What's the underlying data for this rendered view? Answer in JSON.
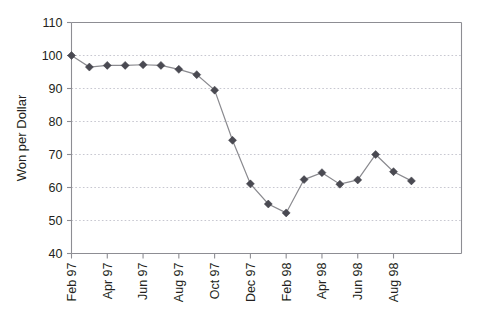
{
  "chart_data": {
    "type": "line",
    "title": "",
    "subtitle": "",
    "xlabel": "",
    "ylabel": "Won per Dollar",
    "ylim": [
      40,
      110
    ],
    "yticks": [
      40,
      50,
      60,
      70,
      80,
      90,
      100,
      110
    ],
    "ytick_labels": [
      "40",
      "50",
      "60",
      "70",
      "80",
      "90",
      "100",
      "110"
    ],
    "grid": "horizontal-dotted",
    "legend": "none",
    "x": [
      "Feb 97",
      "Mar 97",
      "Apr 97",
      "May 97",
      "Jun 97",
      "Jul 97",
      "Aug 97",
      "Sep 97",
      "Oct 97",
      "Nov 97",
      "Dec 97",
      "Jan 98",
      "Feb 98",
      "Mar 98",
      "Apr 98",
      "May 98",
      "Jun 98",
      "Jul 98",
      "Aug 98",
      "Sep 98"
    ],
    "xtick_labels": [
      "Feb 97",
      "Apr 97",
      "Jun 97",
      "Aug 97",
      "Oct 97",
      "Dec 97",
      "Feb 98",
      "Apr 98",
      "Jun 98",
      "Aug 98"
    ],
    "xtick_interval_months": 2,
    "values": [
      100.0,
      96.5,
      97.0,
      97.0,
      97.2,
      97.0,
      95.8,
      94.2,
      89.5,
      74.3,
      61.1,
      55.0,
      52.3,
      62.4,
      64.5,
      61.0,
      62.3,
      70.0,
      64.8,
      62.0
    ],
    "series": [
      {
        "name": "Won per Dollar",
        "marker": "diamond",
        "marker_color": "#4a4a52",
        "line_color": "#8a8a8f",
        "values": [
          100.0,
          96.5,
          97.0,
          97.0,
          97.2,
          97.0,
          95.8,
          94.2,
          89.5,
          74.3,
          61.1,
          55.0,
          52.3,
          62.4,
          64.5,
          61.0,
          62.3,
          70.0,
          64.8,
          62.0
        ]
      }
    ],
    "colors": {
      "background": "#ffffff",
      "axis": "#8d8d93",
      "grid": "#b9b9c4",
      "text": "#231f20",
      "marker": "#4a4a52",
      "line": "#8a8a8f"
    }
  }
}
